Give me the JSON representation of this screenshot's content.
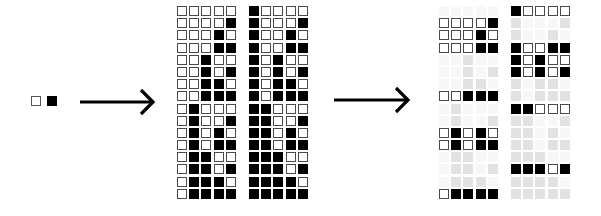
{
  "legend": {
    "items": [
      {
        "label": "0",
        "color": "#ffffff"
      },
      {
        "label": "1",
        "color": "#000000"
      }
    ]
  },
  "arrows": [
    {
      "name": "arrow-to-grids",
      "x1": 80,
      "x2": 153,
      "y": 102
    },
    {
      "name": "arrow-to-selection",
      "x1": 334,
      "x2": 408,
      "y": 100
    }
  ],
  "colors": {
    "on": "#000000",
    "off": "#ffffff",
    "ghost_on": "#e2e2e2",
    "ghost_off": "#f7f7f7",
    "border": "#4a4a4a"
  },
  "grids_full": [
    {
      "name": "grid-0-15",
      "x": 177,
      "y": 6,
      "rows": [
        "00000",
        "00001",
        "00010",
        "00011",
        "00100",
        "00101",
        "00110",
        "00111",
        "01000",
        "01001",
        "01010",
        "01011",
        "01100",
        "01101",
        "01110",
        "01111"
      ]
    },
    {
      "name": "grid-16-31",
      "x": 249,
      "y": 6,
      "rows": [
        "10000",
        "10001",
        "10010",
        "10011",
        "10100",
        "10101",
        "10110",
        "10111",
        "11000",
        "11001",
        "11010",
        "11011",
        "11100",
        "11101",
        "11110",
        "11111"
      ]
    }
  ],
  "grids_selected": [
    {
      "name": "selected-grid-0-15",
      "x": 439,
      "y": 6,
      "rows": [
        "00000",
        "00001",
        "00010",
        "00011",
        "00100",
        "00101",
        "00110",
        "00111",
        "01000",
        "01001",
        "01010",
        "01011",
        "01100",
        "01101",
        "01110",
        "01111"
      ],
      "highlighted": [
        1,
        2,
        3,
        7,
        10,
        11,
        15
      ]
    },
    {
      "name": "selected-grid-16-31",
      "x": 511,
      "y": 6,
      "rows": [
        "10000",
        "10001",
        "10010",
        "10011",
        "10100",
        "10101",
        "10110",
        "10111",
        "11000",
        "11001",
        "11010",
        "11011",
        "11100",
        "11101",
        "11110",
        "11111"
      ],
      "highlighted": [
        0,
        3,
        4,
        5,
        8,
        13
      ]
    }
  ]
}
